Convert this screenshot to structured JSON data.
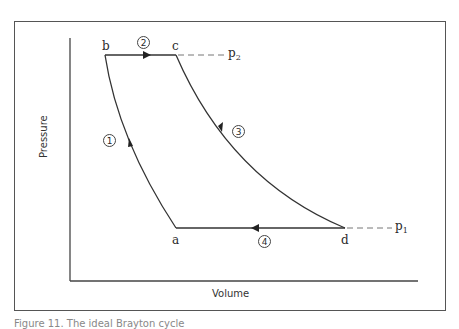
{
  "diagram": {
    "type": "pressure-volume cycle diagram",
    "axes": {
      "x_label": "Volume",
      "y_label": "Pressure"
    },
    "points": [
      {
        "id": "a",
        "label": "a"
      },
      {
        "id": "b",
        "label": "b"
      },
      {
        "id": "c",
        "label": "c"
      },
      {
        "id": "d",
        "label": "d"
      }
    ],
    "pressure_levels": {
      "p1": {
        "symbol": "p",
        "subscript": "1"
      },
      "p2": {
        "symbol": "p",
        "subscript": "2"
      }
    },
    "processes": [
      {
        "step": "1",
        "from": "a",
        "to": "b",
        "shape": "curve",
        "direction": "upward"
      },
      {
        "step": "2",
        "from": "b",
        "to": "c",
        "shape": "horizontal line",
        "direction": "rightward"
      },
      {
        "step": "3",
        "from": "c",
        "to": "d",
        "shape": "curve",
        "direction": "downward"
      },
      {
        "step": "4",
        "from": "d",
        "to": "a",
        "shape": "horizontal line",
        "direction": "leftward"
      }
    ],
    "colors": {
      "line": "#333333",
      "dashed": "#777777",
      "frame": "#555555"
    }
  },
  "caption": {
    "text": "Figure 11. The ideal Brayton cycle"
  }
}
